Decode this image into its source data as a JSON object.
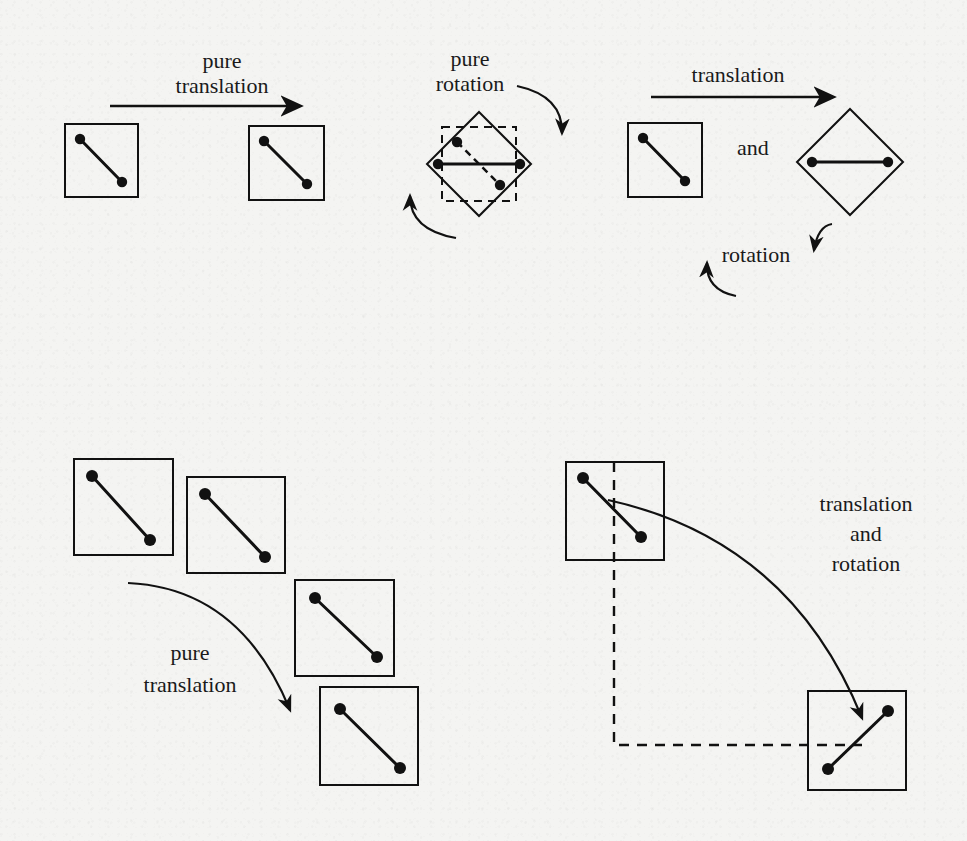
{
  "figure": {
    "background_color": "#f4f4f2",
    "ink_color": "#111111",
    "panels": [
      {
        "id": "pure-translation-top",
        "label_lines": [
          "pure",
          "translation"
        ],
        "label_text": "pure\ntranslation",
        "motion": "pure translation",
        "arrow": "straight-right",
        "shapes": [
          {
            "kind": "square",
            "role": "start",
            "rotation_deg": 0,
            "x": 65,
            "y": 124,
            "size": 73,
            "nodes": [
              [
                80,
                139
              ],
              [
                122,
                182
              ]
            ]
          },
          {
            "kind": "square",
            "role": "end",
            "rotation_deg": 0,
            "x": 249,
            "y": 126,
            "size": 75,
            "nodes": [
              [
                264,
                141
              ],
              [
                307,
                184
              ]
            ]
          }
        ]
      },
      {
        "id": "pure-rotation-top",
        "label_lines": [
          "pure",
          "rotation"
        ],
        "label_text": "pure\nrotation",
        "motion": "pure rotation",
        "arrows": [
          "curved-clockwise-right",
          "curved-counterclockwise-left"
        ],
        "shapes": [
          {
            "kind": "square",
            "role": "start-ghost",
            "style": "dashed",
            "rotation_deg": 0,
            "x": 442,
            "y": 127,
            "size": 74,
            "nodes": [
              [
                457,
                142
              ],
              [
                500,
                185
              ]
            ]
          },
          {
            "kind": "diamond",
            "role": "end",
            "style": "solid",
            "rotation_deg": 45,
            "cx": 479,
            "cy": 164,
            "half_diagonal": 52,
            "nodes": [
              [
                438,
                164
              ],
              [
                520,
                164
              ]
            ]
          }
        ]
      },
      {
        "id": "translation-and-rotation-top",
        "label_translation": "translation",
        "label_and": "and",
        "label_rotation": "rotation",
        "motion": "translation and rotation",
        "arrows": [
          "straight-right",
          "curved-clockwise-right",
          "curved-counterclockwise-left"
        ],
        "shapes": [
          {
            "kind": "square",
            "role": "start",
            "rotation_deg": 0,
            "x": 628,
            "y": 123,
            "size": 74,
            "nodes": [
              [
                643,
                138
              ],
              [
                685,
                181
              ]
            ]
          },
          {
            "kind": "diamond",
            "role": "end",
            "rotation_deg": 45,
            "cx": 850,
            "cy": 162,
            "half_diagonal": 53,
            "nodes": [
              [
                812,
                162
              ],
              [
                888,
                162
              ]
            ]
          }
        ]
      },
      {
        "id": "pure-translation-bottom",
        "label_lines": [
          "pure",
          "translation"
        ],
        "label_text": "pure\ntranslation",
        "motion": "pure translation",
        "arrow": "curved-down-right",
        "shapes": [
          {
            "kind": "square",
            "role": "step-1",
            "rotation_deg": 0,
            "x": 74,
            "y": 459,
            "size": 99,
            "nodes": [
              [
                92,
                476
              ],
              [
                150,
                540
              ]
            ]
          },
          {
            "kind": "square",
            "role": "step-2",
            "rotation_deg": 0,
            "x": 187,
            "y": 469,
            "size": 98,
            "nodes": [
              [
                205,
                494
              ],
              [
                265,
                553
              ]
            ]
          },
          {
            "kind": "square",
            "role": "step-3",
            "rotation_deg": 0,
            "x": 295,
            "y": 580,
            "size": 99,
            "nodes": [
              [
                315,
                598
              ],
              [
                377,
                657
              ]
            ]
          },
          {
            "kind": "square",
            "role": "step-4",
            "rotation_deg": 0,
            "x": 320,
            "y": 687,
            "size": 98,
            "nodes": [
              [
                340,
                709
              ],
              [
                400,
                768
              ]
            ]
          }
        ]
      },
      {
        "id": "translation-and-rotation-bottom",
        "label_lines": [
          "translation",
          "and",
          "rotation"
        ],
        "label_text": "translation\nand\nrotation",
        "motion": "translation and rotation",
        "arrow": "curved-down-right",
        "guides": [
          "vertical-dashed",
          "horizontal-dashed"
        ],
        "shapes": [
          {
            "kind": "square",
            "role": "start",
            "rotation_deg": 0,
            "x": 566,
            "y": 462,
            "size": 98,
            "nodes": [
              [
                583,
                478
              ],
              [
                641,
                536
              ]
            ]
          },
          {
            "kind": "square",
            "role": "end",
            "rotation_deg": 0,
            "x": 808,
            "y": 691,
            "size": 98,
            "nodes": [
              [
                828,
                769
              ],
              [
                888,
                711
              ]
            ]
          }
        ]
      }
    ]
  },
  "labels": {
    "top_left_line1": "pure",
    "top_left_line2": "translation",
    "top_mid_line1": "pure",
    "top_mid_line2": "rotation",
    "top_right_translation": "translation",
    "top_right_and": "and",
    "top_right_rotation": "rotation",
    "bottom_left_line1": "pure",
    "bottom_left_line2": "translation",
    "bottom_right_line1": "translation",
    "bottom_right_line2": "and",
    "bottom_right_line3": "rotation"
  }
}
